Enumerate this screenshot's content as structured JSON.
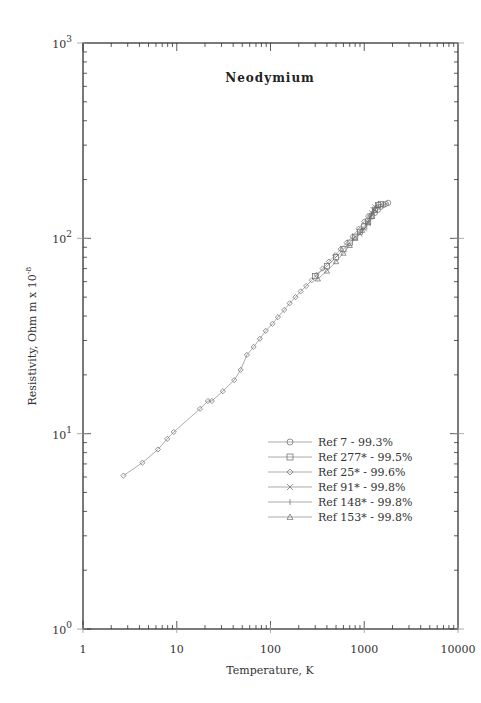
{
  "chart_data": {
    "type": "scatter",
    "title": "Neodymium",
    "xlabel": "Temperature,  K",
    "ylabel": "Resistivity, Ohm m x 10",
    "ylabel_exponent": "-8",
    "xscale": "log",
    "yscale": "log",
    "xlim": [
      1,
      10000
    ],
    "ylim": [
      1,
      1000
    ],
    "x_ticks": [
      "1",
      "10",
      "100",
      "1000",
      "10000"
    ],
    "y_ticks": [
      {
        "base": "10",
        "exp": "0"
      },
      {
        "base": "10",
        "exp": "1"
      },
      {
        "base": "10",
        "exp": "2"
      },
      {
        "base": "10",
        "exp": "3"
      }
    ],
    "grid": false,
    "legend_position": "lower right (inside)",
    "series": [
      {
        "name": "Ref 7 - 99.3%",
        "marker": "circle",
        "points": [
          [
            1300,
            135
          ],
          [
            1400,
            140
          ],
          [
            1500,
            145
          ],
          [
            1600,
            148
          ],
          [
            1700,
            150
          ],
          [
            1800,
            152
          ]
        ]
      },
      {
        "name": "Ref 277* - 99.5%",
        "marker": "square",
        "points": [
          [
            300,
            64
          ],
          [
            400,
            72
          ],
          [
            500,
            80
          ],
          [
            600,
            88
          ],
          [
            700,
            95
          ],
          [
            800,
            102
          ],
          [
            900,
            108
          ],
          [
            1000,
            115
          ],
          [
            1100,
            122
          ],
          [
            1200,
            130
          ],
          [
            1300,
            140
          ],
          [
            1400,
            148
          ],
          [
            1500,
            150
          ]
        ]
      },
      {
        "name": "Ref 25* - 99.6%",
        "marker": "diamond",
        "points": [
          [
            2.7,
            6.1
          ],
          [
            4.3,
            7.1
          ],
          [
            6.3,
            8.3
          ],
          [
            7.9,
            9.4
          ],
          [
            9.3,
            10.2
          ],
          [
            17.7,
            13.4
          ],
          [
            21.5,
            14.7
          ],
          [
            23.7,
            14.7
          ],
          [
            31,
            16.5
          ],
          [
            41,
            18.8
          ],
          [
            48,
            21.2
          ],
          [
            56,
            25.3
          ],
          [
            66,
            27.8
          ],
          [
            77,
            30.6
          ],
          [
            89,
            33.6
          ],
          [
            105,
            36.5
          ],
          [
            120,
            39.5
          ],
          [
            140,
            43
          ],
          [
            160,
            46.5
          ],
          [
            185,
            50
          ],
          [
            210,
            53.5
          ],
          [
            240,
            57
          ],
          [
            275,
            61
          ],
          [
            310,
            65
          ],
          [
            360,
            70
          ],
          [
            420,
            76
          ],
          [
            490,
            82
          ],
          [
            560,
            88
          ],
          [
            650,
            95
          ],
          [
            750,
            102
          ],
          [
            870,
            112
          ],
          [
            1000,
            122
          ],
          [
            1100,
            130
          ]
        ]
      },
      {
        "name": "Ref 91* - 99.8%",
        "marker": "x",
        "points": [
          [
            900,
            105
          ],
          [
            1000,
            112
          ],
          [
            1100,
            120
          ],
          [
            1150,
            128
          ],
          [
            1200,
            135
          ],
          [
            1250,
            140
          ],
          [
            1300,
            145
          ]
        ]
      },
      {
        "name": "Ref 148* - 99.8%",
        "marker": "plus",
        "points": [
          [
            1150,
            125
          ],
          [
            1200,
            132
          ],
          [
            1250,
            138
          ],
          [
            1300,
            143
          ],
          [
            1350,
            147
          ]
        ]
      },
      {
        "name": "Ref 153* - 99.8%",
        "marker": "triangle",
        "points": [
          [
            320,
            62
          ],
          [
            400,
            68
          ],
          [
            500,
            76
          ],
          [
            600,
            84
          ],
          [
            700,
            92
          ],
          [
            800,
            100
          ],
          [
            950,
            110
          ],
          [
            1100,
            120
          ],
          [
            1200,
            130
          ]
        ]
      }
    ]
  },
  "legend": {
    "items": [
      {
        "label": "Ref 7 - 99.3%",
        "marker": "circle-icon"
      },
      {
        "label": "Ref 277* - 99.5%",
        "marker": "square-icon"
      },
      {
        "label": "Ref 25* - 99.6%",
        "marker": "diamond-icon"
      },
      {
        "label": "Ref 91* - 99.8%",
        "marker": "x-icon"
      },
      {
        "label": "Ref 148* - 99.8%",
        "marker": "plus-icon"
      },
      {
        "label": "Ref 153* - 99.8%",
        "marker": "triangle-icon"
      }
    ]
  },
  "colors": {
    "axis": "#333333",
    "series_line": "#888888",
    "marker": "#666666",
    "background": "#ffffff"
  }
}
